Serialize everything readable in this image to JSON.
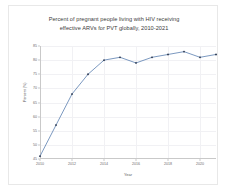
{
  "chart_data": {
    "type": "line",
    "title": "Percent of pregnant people living with HIV receiving effective ARVs for PVT globally, 2010-2021",
    "title_line1": "Percent of pregnant people living with HIV receiving",
    "title_line2": "effective ARVs for PVT globally, 2010-2021",
    "xlabel": "Year",
    "ylabel": "Percent (%)",
    "x": [
      2010,
      2011,
      2012,
      2013,
      2014,
      2015,
      2016,
      2017,
      2018,
      2019,
      2020,
      2021
    ],
    "values": [
      46,
      57,
      68,
      75,
      80,
      81,
      79,
      81,
      82,
      83,
      81,
      82
    ],
    "categories": [
      "2010",
      "2011",
      "2012",
      "2013",
      "2014",
      "2015",
      "2016",
      "2017",
      "2018",
      "2019",
      "2020",
      "2021"
    ],
    "series": [
      {
        "name": "Percent receiving effective ARVs",
        "values": [
          46,
          57,
          68,
          75,
          80,
          81,
          79,
          81,
          82,
          83,
          81,
          82
        ]
      }
    ],
    "xlim": [
      2010,
      2021
    ],
    "ylim": [
      45,
      85
    ],
    "yticks": [
      45,
      50,
      55,
      60,
      65,
      70,
      75,
      80,
      85
    ],
    "ytick_labels": [
      "45",
      "50",
      "55",
      "60",
      "65",
      "70",
      "75",
      "80",
      "85"
    ],
    "xticks": [
      2010,
      2012,
      2014,
      2016,
      2018,
      2020
    ],
    "xtick_labels": [
      "2010",
      "2012",
      "2014",
      "2016",
      "2018",
      "2020"
    ],
    "grid": true,
    "legend": false,
    "legend_position": "none",
    "marker": "diamond",
    "line_color": "#5b7fb0",
    "marker_color": "#2f3b52",
    "grid_color": "#f1f1f4",
    "axis_color": "#c9c9c9",
    "background_color": "#ffffff",
    "border_color": "#e8e8e8"
  }
}
